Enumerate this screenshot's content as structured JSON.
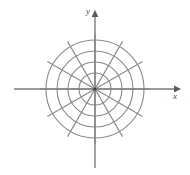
{
  "figure": {
    "type": "polar-grid",
    "width": 190,
    "height": 175,
    "background_color": "#ffffff",
    "grid_color": "#8a8a8a",
    "axis_color": "#7d7d7d",
    "label_color": "#4a4a4a"
  },
  "axes": {
    "x": {
      "label": "x",
      "label_x": 175,
      "label_y": 99,
      "start_x": 14,
      "end_x": 181,
      "y": 89,
      "arrow": "right-arrow"
    },
    "y": {
      "label": "y",
      "label_x": 88,
      "label_y": 14,
      "start_y": 168,
      "end_y": 10,
      "x": 95,
      "arrow": "up-arrow"
    }
  },
  "chart_data": {
    "type": "polar-grid",
    "title": "",
    "xlabel": "x",
    "ylabel": "y",
    "center": [
      95,
      89
    ],
    "circle_radii": [
      16,
      27,
      38,
      49
    ],
    "circle_count": 4,
    "spoke_count": 12,
    "spoke_angle_step_degrees": 30,
    "spoke_angles_degrees": [
      0,
      30,
      60,
      90,
      120,
      150,
      180,
      210,
      240,
      270,
      300,
      330
    ],
    "spoke_radius": 55,
    "grid": true,
    "legend": "none",
    "tick_labels": [],
    "data_points": []
  }
}
